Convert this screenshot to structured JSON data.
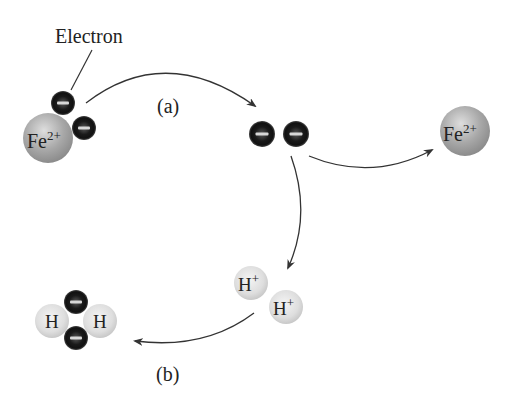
{
  "labels": {
    "electron": "Electron",
    "step_a": "(a)",
    "step_b": "(b)"
  },
  "species": {
    "fe_left": {
      "symbol": "Fe",
      "charge": "2+"
    },
    "fe_right": {
      "symbol": "Fe",
      "charge": "2+"
    },
    "h_plus_1": {
      "symbol": "H",
      "charge": "+"
    },
    "h_plus_2": {
      "symbol": "H",
      "charge": "+"
    },
    "h2_left": {
      "symbol": "H"
    },
    "h2_right": {
      "symbol": "H"
    }
  },
  "colors": {
    "electron_dark": "#111111",
    "electron_mid": "#3a3a3a",
    "fe_sphere": "#a9a9a9",
    "h_sphere": "#e2e2e2",
    "arrow": "#333333",
    "text": "#222222"
  }
}
